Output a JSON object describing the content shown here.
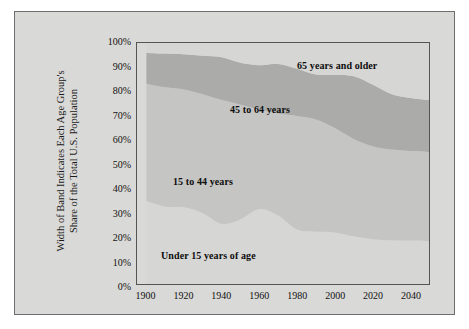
{
  "figure": {
    "background": "#d9d9d7",
    "frame_color": "#6d6d6d"
  },
  "axis": {
    "ylabel_line1": "Width of Band Indicates Each Age Group's",
    "ylabel_line2": "Share of the Total U.S. Population",
    "yticks": [
      "100%",
      "90%",
      "80%",
      "70%",
      "60%",
      "50%",
      "40%",
      "30%",
      "20%",
      "10%",
      "0%"
    ],
    "xticks": [
      "1900",
      "1920",
      "1940",
      "1960",
      "1980",
      "2000",
      "2020",
      "2040"
    ]
  },
  "labels": {
    "band_65": "65 years and older",
    "band_45_64": "45 to 64 years",
    "band_15_44": "15 to 44 years",
    "band_under_15": "Under 15 years of age"
  },
  "chart_data": {
    "type": "area",
    "stacked": true,
    "normalized_percent": true,
    "title": "",
    "xlabel": "",
    "ylabel": "Width of Band Indicates Each Age Group's Share of the Total U.S. Population",
    "xlim": [
      1895,
      2050
    ],
    "ylim": [
      0,
      100
    ],
    "grid": false,
    "legend": "inline-band-labels",
    "x": [
      1900,
      1910,
      1920,
      1930,
      1940,
      1950,
      1960,
      1970,
      1980,
      1990,
      2000,
      2010,
      2020,
      2030,
      2040,
      2050
    ],
    "series": [
      {
        "name": "Under 15 years of age",
        "color": "#d6d6d4",
        "values": [
          34.4,
          32.1,
          31.8,
          29.4,
          25.0,
          26.9,
          31.1,
          28.4,
          22.6,
          21.7,
          21.4,
          19.8,
          18.6,
          18.2,
          18.0,
          17.8
        ]
      },
      {
        "name": "15 to 44 years",
        "color": "#c5c5c3",
        "values": [
          48.7,
          49.5,
          48.9,
          49.3,
          51.3,
          47.5,
          41.3,
          42.3,
          47.1,
          46.6,
          43.3,
          40.4,
          38.6,
          37.6,
          37.2,
          37.0
        ]
      },
      {
        "name": "45 to 64 years",
        "color": "#ababa9",
        "values": [
          12.8,
          14.0,
          14.6,
          16.0,
          17.8,
          17.4,
          18.4,
          20.6,
          19.6,
          18.6,
          22.0,
          26.0,
          25.6,
          23.0,
          22.0,
          21.5
        ]
      },
      {
        "name": "65 years and older",
        "color": "#d6d6d4",
        "values": [
          4.1,
          4.4,
          4.7,
          5.3,
          5.9,
          8.2,
          9.2,
          8.7,
          10.7,
          13.1,
          13.3,
          13.8,
          17.2,
          21.2,
          22.8,
          23.7
        ]
      }
    ]
  }
}
